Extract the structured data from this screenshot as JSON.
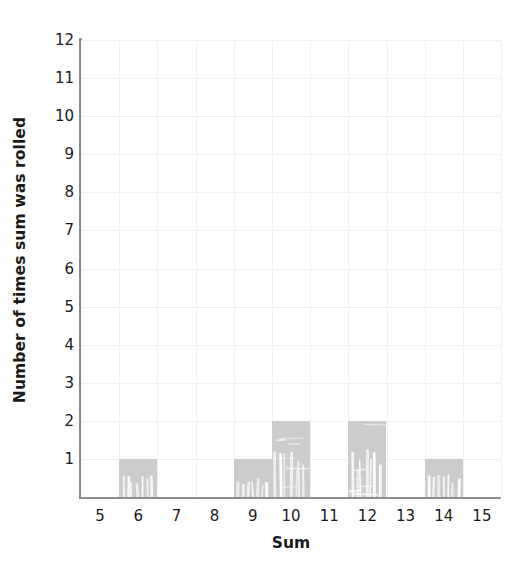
{
  "chart_data": {
    "type": "bar",
    "title": "",
    "subtitle": "",
    "xlabel": "Sum",
    "ylabel": "Number of times sum was rolled",
    "categories": [
      5,
      6,
      7,
      8,
      9,
      10,
      11,
      12,
      13,
      14,
      15
    ],
    "values": [
      0,
      1,
      0,
      0,
      1,
      2,
      0,
      2,
      0,
      1,
      0
    ],
    "xlim": [
      4.5,
      15.5
    ],
    "ylim": [
      0,
      12
    ],
    "x_ticks": [
      "5",
      "6",
      "7",
      "8",
      "9",
      "10",
      "11",
      "12",
      "13",
      "14",
      "15"
    ],
    "y_ticks": [
      "1",
      "2",
      "3",
      "4",
      "5",
      "6",
      "7",
      "8",
      "9",
      "10",
      "11",
      "12"
    ],
    "grid": true,
    "legend": "none",
    "bar_color": "#cccccc",
    "axis_color": "#8d8d8d",
    "grid_color": "#f1f1f1",
    "text_color": "#1a1a1a"
  }
}
